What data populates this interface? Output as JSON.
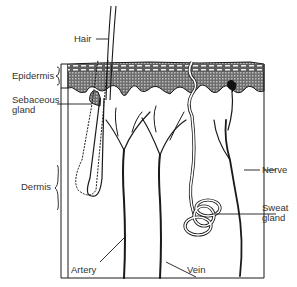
{
  "diagram": {
    "labels": {
      "hair": "Hair",
      "epidermis": "Epidermis",
      "sebaceous_line1": "Sebaceous",
      "sebaceous_line2": "gland",
      "dermis": "Dermis",
      "nerve": "Nerve",
      "sweat_line1": "Sweat",
      "sweat_line2": "gland",
      "artery": "Artery",
      "vein": "Vein"
    },
    "colors": {
      "stroke": "#1a1a1a",
      "background": "#ffffff",
      "shading": "#8a8a8a"
    }
  }
}
